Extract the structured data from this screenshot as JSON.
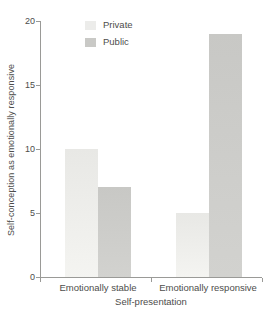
{
  "chart_data": {
    "type": "bar",
    "title": "",
    "categories": [
      "Emotionally stable",
      "Emotionally responsive"
    ],
    "series": [
      {
        "name": "Private",
        "values": [
          10,
          5
        ],
        "color": "#ececea"
      },
      {
        "name": "Public",
        "values": [
          7,
          19
        ],
        "color": "#c9c9c6"
      }
    ],
    "xlabel": "Self-presentation",
    "ylabel": "Self-conception as emotionally responsive",
    "ylim": [
      0,
      20
    ],
    "yticks": [
      0,
      5,
      10,
      15,
      20
    ],
    "grid": false,
    "legend_position": "top-left-inside"
  },
  "colors": {
    "axis": "#9a9a97",
    "text": "#4d4d4b",
    "private_bar_top": "#e8e8e5",
    "private_bar_bottom": "#f4f4f1",
    "public_bar_top": "#c8c8c5",
    "public_bar_bottom": "#d2d2cf",
    "background": "#ffffff"
  }
}
